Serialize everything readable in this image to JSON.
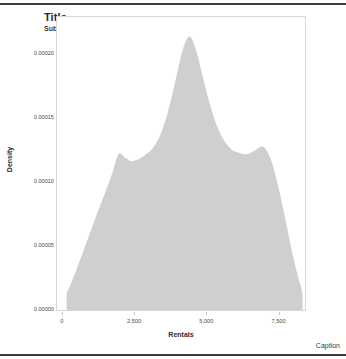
{
  "chart_data": {
    "type": "area",
    "title": "Title",
    "subtitle": "Subtitle",
    "caption": "Caption",
    "xlabel": "Rentals",
    "ylabel": "Density",
    "xlim": [
      -200,
      8380
    ],
    "ylim": [
      0,
      0.0002285
    ],
    "grid": false,
    "legend": "none",
    "fill_color": "#cfcfcf",
    "xticks": [
      0,
      2500,
      5000,
      7500
    ],
    "xtick_labels": [
      "0",
      "2,500",
      "5,000",
      "7,500"
    ],
    "yticks": [
      0.0,
      5e-05,
      0.0001,
      0.00015,
      0.0002
    ],
    "ytick_labels": [
      "0.00000",
      "0.00005",
      "0.00010",
      "0.00015",
      "0.00020"
    ],
    "x": [
      130,
      300,
      500,
      700,
      900,
      1100,
      1300,
      1500,
      1700,
      1930,
      2150,
      2350,
      2550,
      2750,
      2950,
      3150,
      3400,
      3650,
      3900,
      4150,
      4380,
      4600,
      4850,
      5100,
      5350,
      5600,
      5850,
      6100,
      6350,
      6600,
      6930,
      7200,
      7450,
      7700,
      7950,
      8150,
      8280,
      8300
    ],
    "values": [
      1.29e-05,
      2.14e-05,
      3.31e-05,
      4.52e-05,
      5.76e-05,
      7e-05,
      8.19e-05,
      9.35e-05,
      0.0001058,
      0.0001217,
      0.0001189,
      0.0001161,
      0.0001169,
      0.0001193,
      0.0001226,
      0.0001274,
      0.0001379,
      0.0001556,
      0.000179,
      0.0002028,
      0.0002133,
      0.0002036,
      0.0001814,
      0.0001597,
      0.0001427,
      0.0001314,
      0.000125,
      0.0001226,
      0.0001214,
      0.0001238,
      0.0001274,
      0.0001173,
      9.68e-05,
      7.1e-05,
      4.35e-05,
      2.5e-05,
      1.45e-05,
      0.0
    ]
  }
}
